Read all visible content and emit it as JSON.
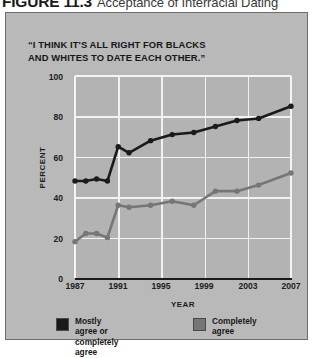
{
  "figure": {
    "number": "FIGURE 11.3",
    "title": "Acceptance of Interracial Dating",
    "quote": "“I THINK IT'S ALL RIGHT FOR BLACKS\n AND WHITES TO DATE EACH OTHER.”"
  },
  "colors": {
    "panel_background": "#b9b9b9",
    "plot_background": "#b3b3b3",
    "gridline": "#f2f2f2",
    "series_black": "#1a1a1a",
    "series_gray": "#767676",
    "axis": "#1a1a1a",
    "text": "#171717"
  },
  "legend": {
    "position": "bottom",
    "items": [
      {
        "label": "Mostly agree or\ncompletely agree",
        "color": "#1a1a1a"
      },
      {
        "label": "Completely agree",
        "color": "#767676"
      }
    ]
  },
  "axes": {
    "y_label": "PERCENT",
    "x_label": "YEAR",
    "y_ticks": [
      "0",
      "20",
      "40",
      "60",
      "80",
      "100"
    ],
    "x_ticks": [
      "1987",
      "1991",
      "1995",
      "1999",
      "2003",
      "2007"
    ]
  },
  "chart_data": {
    "type": "line",
    "title": "“I THINK IT'S ALL RIGHT FOR BLACKS AND WHITES TO DATE EACH OTHER.”",
    "xlabel": "YEAR",
    "ylabel": "PERCENT",
    "xlim": [
      1987,
      2007
    ],
    "ylim": [
      0,
      100
    ],
    "grid": true,
    "legend_position": "bottom",
    "x": [
      1987,
      1988,
      1989,
      1990,
      1991,
      1992,
      1994,
      1996,
      1998,
      2000,
      2002,
      2004,
      2007
    ],
    "series": [
      {
        "name": "Mostly agree or completely agree",
        "color": "#1a1a1a",
        "values": [
          48,
          48,
          49,
          48,
          65,
          62,
          68,
          71,
          72,
          75,
          78,
          79,
          85
        ]
      },
      {
        "name": "Completely agree",
        "color": "#767676",
        "values": [
          18,
          22,
          22,
          20,
          36,
          35,
          36,
          38,
          36,
          43,
          43,
          46,
          52
        ]
      }
    ]
  }
}
